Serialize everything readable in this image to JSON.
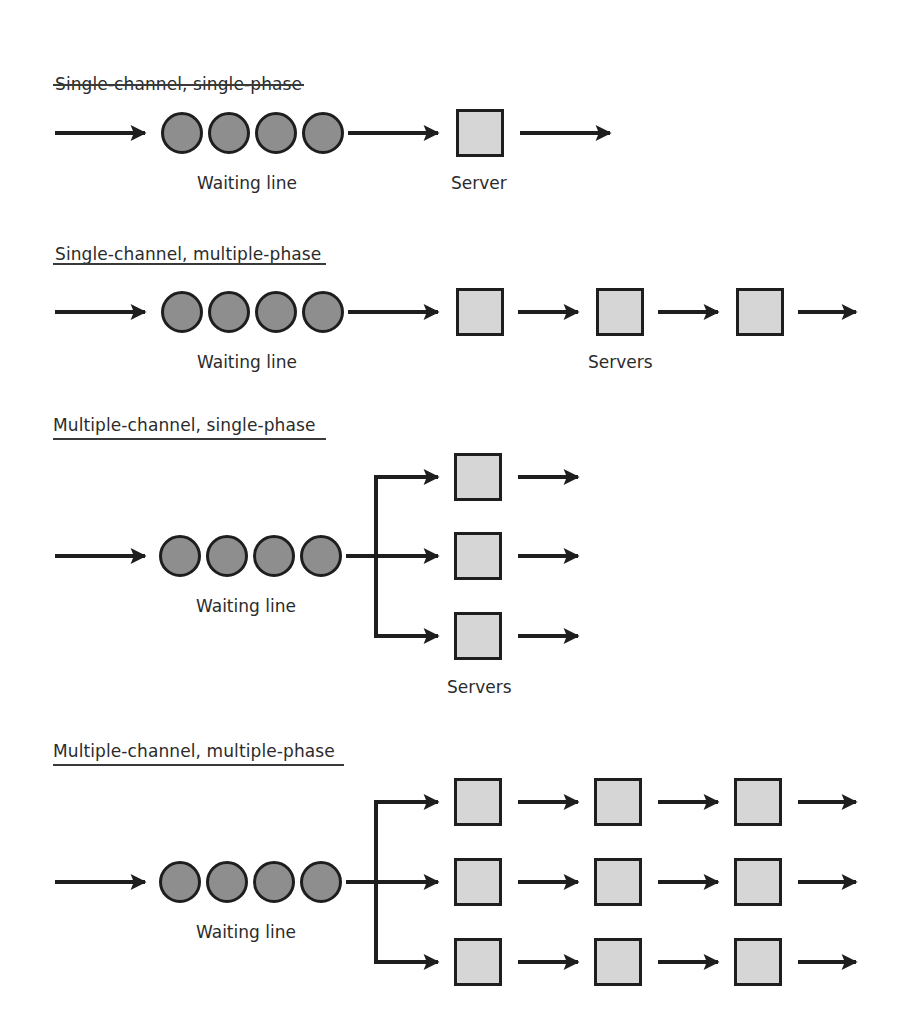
{
  "diagram": {
    "sections": [
      {
        "title": "Single-channel, single-phase",
        "queue_label": "Waiting line",
        "server_label": "Server",
        "channels": 1,
        "phases": 1
      },
      {
        "title": "Single-channel, multiple-phase",
        "queue_label": "Waiting line",
        "server_label": "Servers",
        "channels": 1,
        "phases": 3
      },
      {
        "title": "Multiple-channel, single-phase",
        "queue_label": "Waiting line",
        "server_label": "Servers",
        "channels": 3,
        "phases": 1
      },
      {
        "title": "Multiple-channel, multiple-phase",
        "queue_label": "Waiting line",
        "server_label": "",
        "channels": 3,
        "phases": 3
      }
    ],
    "colors": {
      "customer_fill": "#8e8e8e",
      "server_fill": "#d6d6d6",
      "stroke": "#1e1e1e"
    }
  }
}
